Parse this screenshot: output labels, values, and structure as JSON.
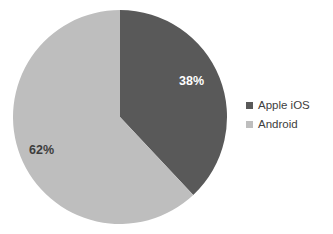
{
  "chart_data": {
    "type": "pie",
    "title": "",
    "categories": [
      "Apple iOS",
      "Android"
    ],
    "values": [
      38,
      62
    ],
    "value_labels": [
      "38%",
      "62%"
    ],
    "colors": [
      "#595959",
      "#bebebe"
    ],
    "legend_position": "right",
    "grid": false,
    "background": "#ffffff",
    "start_angle_deg": 0,
    "direction": "clockwise",
    "slices": [
      {
        "name": "Apple iOS",
        "value": 38,
        "label": "38%",
        "color": "#595959",
        "label_color": "#ffffff"
      },
      {
        "name": "Android",
        "value": 62,
        "label": "62%",
        "color": "#bebebe",
        "label_color": "#3d3d3d"
      }
    ]
  },
  "legend": {
    "items": [
      {
        "label": "Apple iOS",
        "color": "#595959"
      },
      {
        "label": "Android",
        "color": "#bebebe"
      }
    ]
  }
}
